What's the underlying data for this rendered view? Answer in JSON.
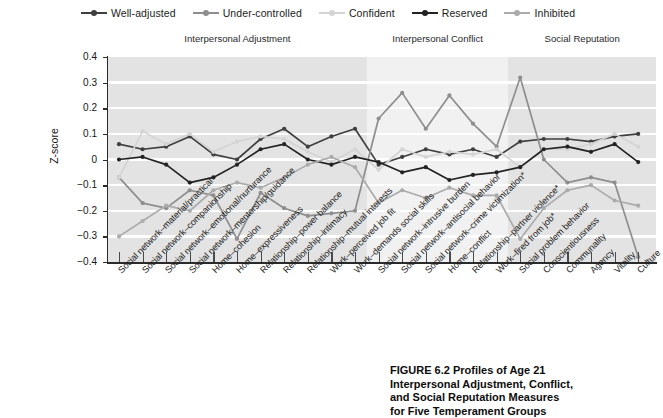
{
  "legend": {
    "items": [
      {
        "label": "Well-adjusted",
        "color": "#3f3f3f"
      },
      {
        "label": "Under-controlled",
        "color": "#8e8e8e"
      },
      {
        "label": "Confident",
        "color": "#d4d4d4"
      },
      {
        "label": "Reserved",
        "color": "#232323"
      },
      {
        "label": "Inhibited",
        "color": "#ababab"
      }
    ]
  },
  "bands": [
    {
      "label": "Interpersonal Adjustment",
      "start": 0,
      "end": 11,
      "shade": "#e3e3e3"
    },
    {
      "label": "Interpersonal Conflict",
      "start": 11,
      "end": 17,
      "shade": "#f1f1f1"
    },
    {
      "label": "Social Reputation",
      "start": 17,
      "end": 23,
      "shade": "#e3e3e3"
    }
  ],
  "caption": {
    "line1": "FIGURE 6.2  Profiles of Age 21",
    "line2": "Interpersonal Adjustment, Conflict,",
    "line3": "and Social Reputation Measures",
    "line4": "for Five Temperament Groups"
  },
  "chart_data": {
    "type": "line",
    "title": "",
    "xlabel": "",
    "ylabel": "Z-score",
    "ylim": [
      -0.4,
      0.4
    ],
    "ytick_labels": [
      "0.4",
      "0.3",
      "0.2",
      "0.1",
      "0",
      "−0.1",
      "−0.2",
      "−0.3",
      "−0.4"
    ],
    "ytick_values": [
      0.4,
      0.3,
      0.2,
      0.1,
      0,
      -0.1,
      -0.2,
      -0.3,
      -0.4
    ],
    "grid": true,
    "legend_position": "top",
    "categories": [
      "Social network–material/practical",
      "Social network–companionship",
      "Social network–emotional/nurturance",
      "Social network–mentorship/guidance",
      "Home–cohesion",
      "Home–expressiveness",
      "Relationship–power balance",
      "Relationship–intimacy",
      "Relationship–mutual interests",
      "Work–perceived job fit",
      "Work–demands social skills",
      "Social network–intrusive burden",
      "Social network–antisocial behavior",
      "Social network–crime victimization*",
      "Home–conflict",
      "Relationship–partner violence*",
      "Work–fired from job*",
      "Social problem behavior",
      "Conscientiousness",
      "Communality",
      "Agency",
      "Vitality",
      "Culture"
    ],
    "series": [
      {
        "name": "Well-adjusted",
        "color": "#3f3f3f",
        "values": [
          0.06,
          0.04,
          0.05,
          0.09,
          0.02,
          0.0,
          0.08,
          0.12,
          0.05,
          0.09,
          0.12,
          -0.02,
          0.01,
          0.04,
          0.02,
          0.04,
          0.01,
          0.07,
          0.08,
          0.08,
          0.07,
          0.09,
          0.1
        ]
      },
      {
        "name": "Under-controlled",
        "color": "#8e8e8e",
        "values": [
          -0.07,
          -0.17,
          -0.19,
          -0.12,
          -0.14,
          -0.31,
          -0.13,
          -0.19,
          -0.22,
          -0.21,
          -0.2,
          0.16,
          0.26,
          0.12,
          0.25,
          0.14,
          0.05,
          0.32,
          0.0,
          -0.09,
          -0.07,
          -0.09,
          -0.38
        ]
      },
      {
        "name": "Confident",
        "color": "#d4d4d4",
        "values": [
          -0.07,
          0.11,
          0.06,
          0.1,
          0.03,
          0.07,
          0.09,
          0.08,
          0.03,
          -0.01,
          0.04,
          -0.04,
          0.04,
          0.01,
          0.03,
          0.02,
          0.04,
          -0.03,
          0.04,
          0.04,
          0.06,
          0.1,
          0.05
        ]
      },
      {
        "name": "Reserved",
        "color": "#232323",
        "values": [
          0.0,
          0.01,
          -0.02,
          -0.09,
          -0.07,
          -0.02,
          0.04,
          0.06,
          0.0,
          -0.02,
          0.01,
          -0.01,
          -0.05,
          -0.03,
          -0.08,
          -0.06,
          -0.05,
          -0.03,
          0.04,
          0.05,
          0.03,
          0.06,
          -0.01
        ]
      },
      {
        "name": "Inhibited",
        "color": "#ababab",
        "values": [
          -0.3,
          -0.24,
          -0.18,
          -0.2,
          -0.12,
          -0.09,
          -0.11,
          -0.07,
          -0.02,
          0.01,
          -0.03,
          -0.17,
          -0.12,
          -0.15,
          -0.11,
          -0.14,
          -0.14,
          -0.31,
          -0.19,
          -0.12,
          -0.1,
          -0.16,
          -0.18
        ]
      }
    ]
  }
}
